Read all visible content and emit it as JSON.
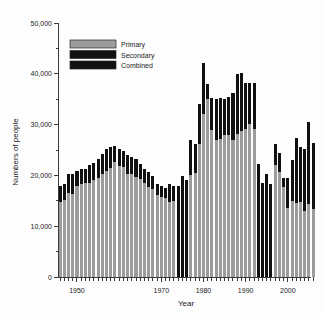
{
  "chart_data": {
    "type": "bar",
    "stacked": true,
    "title": "",
    "xlabel": "Year",
    "ylabel": "Numbers of people",
    "xlim": [
      1945.5,
      2005.5
    ],
    "ylim": [
      0,
      50000
    ],
    "grid": false,
    "legend_position": "top-left",
    "x_ticks_major": [
      1950,
      1970,
      1980,
      1990,
      2000
    ],
    "x_tick_labels": [
      "1950",
      "1970",
      "1980",
      "1990",
      "2000"
    ],
    "y_ticks_major": [
      0,
      10000,
      20000,
      30000,
      40000,
      50000
    ],
    "y_tick_labels": [
      "0",
      "10,000",
      "20,000",
      "30,000",
      "40,000",
      "50,000"
    ],
    "y_ticks_minor": [
      5000,
      15000,
      25000,
      35000,
      45000
    ],
    "series": [
      {
        "name": "Primary",
        "color": "#9c9c9c",
        "values": [
          14800,
          15100,
          16600,
          16300,
          17900,
          18300,
          18500,
          18600,
          19000,
          19500,
          20300,
          20900,
          21500,
          22600,
          21900,
          21600,
          20300,
          20200,
          19700,
          19300,
          18600,
          17800,
          17400,
          16200,
          15700,
          15500,
          14700,
          15000,
          0,
          0,
          0,
          20100,
          20400,
          26100,
          32100,
          35100,
          28900,
          27000,
          27200,
          28000,
          27900,
          27000,
          28100,
          28800,
          29100,
          30100,
          29100,
          0,
          0,
          0,
          0,
          22100,
          20600,
          17800,
          13500,
          14900,
          14500,
          14700,
          12900,
          14300,
          13400
        ]
      },
      {
        "name": "Secondary",
        "color": "#111111",
        "values": [
          0,
          0,
          0,
          0,
          0,
          0,
          0,
          0,
          0,
          0,
          0,
          0,
          0,
          0,
          0,
          0,
          0,
          0,
          0,
          0,
          0,
          0,
          0,
          0,
          0,
          0,
          0,
          0,
          0,
          0,
          0,
          0,
          0,
          0,
          0,
          0,
          0,
          0,
          0,
          0,
          0,
          0,
          0,
          0,
          0,
          0,
          0,
          0,
          0,
          0,
          0,
          0,
          0,
          0,
          0,
          0,
          0,
          0,
          0,
          0,
          0
        ]
      },
      {
        "name": "Combined",
        "color": "#111111",
        "values": [
          3100,
          3300,
          3600,
          3900,
          3000,
          2900,
          2700,
          3400,
          3500,
          3800,
          4000,
          4200,
          4100,
          3200,
          3300,
          3200,
          3800,
          3500,
          3500,
          3000,
          2700,
          2800,
          2400,
          2100,
          2300,
          2000,
          3600,
          3000,
          17900,
          19900,
          19000,
          6800,
          5800,
          8000,
          10100,
          2900,
          6300,
          8000,
          8000,
          7100,
          7500,
          9300,
          11900,
          11400,
          9000,
          8000,
          9000,
          22300,
          18500,
          20200,
          18400,
          4100,
          3800,
          1600,
          5900,
          8200,
          12800,
          10900,
          12300,
          16200,
          13000
        ]
      }
    ],
    "years": [
      1946,
      1947,
      1948,
      1949,
      1950,
      1951,
      1952,
      1953,
      1954,
      1955,
      1956,
      1957,
      1958,
      1959,
      1960,
      1961,
      1962,
      1963,
      1964,
      1965,
      1966,
      1967,
      1968,
      1969,
      1970,
      1971,
      1972,
      1973,
      1974,
      1975,
      1976,
      1977,
      1978,
      1979,
      1980,
      1981,
      1982,
      1983,
      1984,
      1985,
      1986,
      1987,
      1988,
      1989,
      1990,
      1991,
      1992,
      1993,
      1994,
      1995,
      1996,
      1997,
      1998,
      1999,
      2000,
      2001,
      2002,
      2003,
      2004,
      2005,
      2006
    ]
  },
  "legend": {
    "items": [
      {
        "label": "Primary",
        "color": "#9c9c9c"
      },
      {
        "label": "Secondary",
        "color": "#111111"
      },
      {
        "label": "Combined",
        "color": "#111111"
      }
    ]
  },
  "axes": {
    "x_title": "Year",
    "y_title": "Numbers of people"
  }
}
